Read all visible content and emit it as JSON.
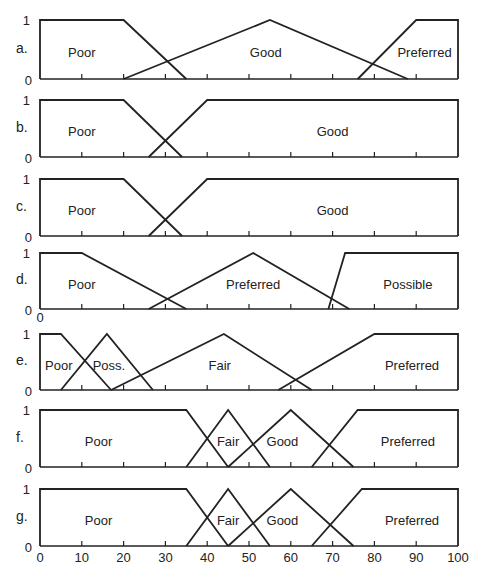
{
  "chart_data": [
    {
      "id": "a",
      "type": "line",
      "panel_label": "a.",
      "xlim": [
        0,
        100
      ],
      "ylim": [
        0,
        1
      ],
      "ytick_labels": [
        "0",
        "1"
      ],
      "xticks": [
        10,
        20,
        30,
        40,
        50,
        60,
        70,
        80,
        90
      ],
      "layout": {
        "top": 20,
        "bottom": 79
      },
      "series": [
        {
          "name": "Poor",
          "points": [
            [
              0,
              0
            ],
            [
              0,
              1
            ],
            [
              20,
              1
            ],
            [
              35,
              0
            ]
          ],
          "label_x": 10,
          "label_y": 0.4
        },
        {
          "name": "Good",
          "points": [
            [
              20,
              0
            ],
            [
              55,
              1
            ],
            [
              88,
              0
            ]
          ],
          "label_x": 54,
          "label_y": 0.4
        },
        {
          "name": "Preferred",
          "points": [
            [
              76,
              0
            ],
            [
              90,
              1
            ],
            [
              100,
              1
            ],
            [
              100,
              0
            ]
          ],
          "label_x": 92,
          "label_y": 0.4
        }
      ]
    },
    {
      "id": "b",
      "type": "line",
      "panel_label": "b.",
      "xlim": [
        0,
        100
      ],
      "ylim": [
        0,
        1
      ],
      "ytick_labels": [
        "0",
        "1"
      ],
      "xticks": [
        10,
        20,
        30,
        40,
        50,
        60,
        70,
        80,
        90
      ],
      "layout": {
        "top": 100,
        "bottom": 157
      },
      "series": [
        {
          "name": "Poor",
          "points": [
            [
              0,
              0
            ],
            [
              0,
              1
            ],
            [
              20,
              1
            ],
            [
              34,
              0
            ]
          ],
          "label_x": 10,
          "label_y": 0.4
        },
        {
          "name": "Good",
          "points": [
            [
              26,
              0
            ],
            [
              40,
              1
            ],
            [
              100,
              1
            ],
            [
              100,
              0
            ]
          ],
          "label_x": 70,
          "label_y": 0.4
        }
      ]
    },
    {
      "id": "c",
      "type": "line",
      "panel_label": "c.",
      "xlim": [
        0,
        100
      ],
      "ylim": [
        0,
        1
      ],
      "ytick_labels": [
        "0",
        "1"
      ],
      "xticks": [
        10,
        20,
        30,
        40,
        50,
        60,
        70,
        80,
        90
      ],
      "layout": {
        "top": 179,
        "bottom": 236
      },
      "series": [
        {
          "name": "Poor",
          "points": [
            [
              0,
              0
            ],
            [
              0,
              1
            ],
            [
              20,
              1
            ],
            [
              34,
              0
            ]
          ],
          "label_x": 10,
          "label_y": 0.4
        },
        {
          "name": "Good",
          "points": [
            [
              26,
              0
            ],
            [
              40,
              1
            ],
            [
              100,
              1
            ],
            [
              100,
              0
            ]
          ],
          "label_x": 70,
          "label_y": 0.4
        }
      ]
    },
    {
      "id": "d",
      "type": "line",
      "panel_label": "d.",
      "xlim": [
        0,
        100
      ],
      "ylim": [
        0,
        1
      ],
      "ytick_labels": [
        "0",
        "1"
      ],
      "extra_xtick_label": "0",
      "xticks": [
        10,
        20,
        30,
        40,
        50,
        60,
        70,
        80,
        90
      ],
      "layout": {
        "top": 253,
        "bottom": 309
      },
      "series": [
        {
          "name": "Poor",
          "points": [
            [
              0,
              0
            ],
            [
              0,
              1
            ],
            [
              10,
              1
            ],
            [
              35,
              0
            ]
          ],
          "label_x": 10,
          "label_y": 0.4
        },
        {
          "name": "Preferred",
          "points": [
            [
              26,
              0
            ],
            [
              51,
              1
            ],
            [
              74,
              0
            ]
          ],
          "label_x": 51,
          "label_y": 0.4
        },
        {
          "name": "Possible",
          "points": [
            [
              69,
              0
            ],
            [
              73,
              1
            ],
            [
              100,
              1
            ],
            [
              100,
              0
            ]
          ],
          "label_x": 88,
          "label_y": 0.4
        }
      ]
    },
    {
      "id": "e",
      "type": "line",
      "panel_label": "e.",
      "xlim": [
        0,
        100
      ],
      "ylim": [
        0,
        1
      ],
      "ytick_labels": [
        "0",
        "1"
      ],
      "xticks": [
        10,
        20,
        30,
        40,
        50,
        60,
        70,
        80,
        90
      ],
      "layout": {
        "top": 334,
        "bottom": 390
      },
      "series": [
        {
          "name": "Poor",
          "points": [
            [
              0,
              0
            ],
            [
              0,
              1
            ],
            [
              5,
              1
            ],
            [
              17,
              0
            ]
          ],
          "label_x": 4.5,
          "label_y": 0.4
        },
        {
          "name": "Poss.",
          "points": [
            [
              5,
              0
            ],
            [
              16,
              1
            ],
            [
              27,
              0
            ]
          ],
          "label_x": 16.5,
          "label_y": 0.4
        },
        {
          "name": "Fair",
          "points": [
            [
              17,
              0
            ],
            [
              44,
              1
            ],
            [
              65,
              0
            ]
          ],
          "label_x": 43,
          "label_y": 0.4
        },
        {
          "name": "Preferred",
          "points": [
            [
              57,
              0
            ],
            [
              80,
              1
            ],
            [
              100,
              1
            ],
            [
              100,
              0
            ]
          ],
          "label_x": 89,
          "label_y": 0.4
        }
      ]
    },
    {
      "id": "f",
      "type": "line",
      "panel_label": "f.",
      "xlim": [
        0,
        100
      ],
      "ylim": [
        0,
        1
      ],
      "ytick_labels": [
        "0",
        "1"
      ],
      "xticks": [
        10,
        20,
        30,
        40,
        50,
        60,
        70,
        80,
        90
      ],
      "layout": {
        "top": 410,
        "bottom": 467
      },
      "series": [
        {
          "name": "Poor",
          "points": [
            [
              0,
              0
            ],
            [
              0,
              1
            ],
            [
              35,
              1
            ],
            [
              45,
              0
            ]
          ],
          "label_x": 14,
          "label_y": 0.4
        },
        {
          "name": "Fair",
          "points": [
            [
              35,
              0
            ],
            [
              45,
              1
            ],
            [
              55,
              0
            ]
          ],
          "label_x": 45,
          "label_y": 0.4
        },
        {
          "name": "Good",
          "points": [
            [
              45,
              0
            ],
            [
              60,
              1
            ],
            [
              75,
              0
            ]
          ],
          "label_x": 58,
          "label_y": 0.4
        },
        {
          "name": "Preferred",
          "points": [
            [
              65,
              0
            ],
            [
              76,
              1
            ],
            [
              100,
              1
            ],
            [
              100,
              0
            ]
          ],
          "label_x": 88,
          "label_y": 0.4
        }
      ]
    },
    {
      "id": "g",
      "type": "line",
      "panel_label": "g.",
      "xlim": [
        0,
        100
      ],
      "ylim": [
        0,
        1
      ],
      "ytick_labels": [
        "0",
        "1"
      ],
      "xticks": [
        10,
        20,
        30,
        40,
        50,
        60,
        70,
        80,
        90
      ],
      "xtick_labels": [
        "0",
        "10",
        "20",
        "30",
        "40",
        "50",
        "60",
        "70",
        "80",
        "90",
        "100"
      ],
      "layout": {
        "top": 489,
        "bottom": 546
      },
      "series": [
        {
          "name": "Poor",
          "points": [
            [
              0,
              0
            ],
            [
              0,
              1
            ],
            [
              35,
              1
            ],
            [
              45,
              0
            ]
          ],
          "label_x": 14,
          "label_y": 0.4
        },
        {
          "name": "Fair",
          "points": [
            [
              35,
              0
            ],
            [
              45,
              1
            ],
            [
              55,
              0
            ]
          ],
          "label_x": 45,
          "label_y": 0.4
        },
        {
          "name": "Good",
          "points": [
            [
              45,
              0
            ],
            [
              60,
              1
            ],
            [
              75,
              0
            ]
          ],
          "label_x": 58,
          "label_y": 0.4
        },
        {
          "name": "Preferred",
          "points": [
            [
              65,
              0
            ],
            [
              77,
              1
            ],
            [
              100,
              1
            ],
            [
              100,
              0
            ]
          ],
          "label_x": 89,
          "label_y": 0.4
        }
      ]
    }
  ],
  "style": {
    "line_color": "#222222",
    "background": "#ffffff",
    "x0_px": 40,
    "x100_px": 458
  }
}
